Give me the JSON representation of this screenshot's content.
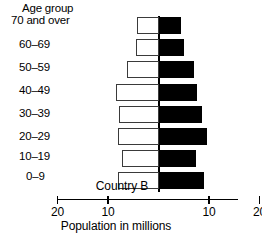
{
  "chart_data": {
    "type": "bar",
    "subtype": "population-pyramid",
    "title": "",
    "series_caption": "Country B",
    "category_axis_label": "Age group",
    "xlabel": "Population in millions",
    "ylabel": "Age group",
    "grid": false,
    "legend": "none",
    "orientation": "horizontal-diverging",
    "categories": [
      "70 and over",
      "60–69",
      "50–59",
      "40–49",
      "30–39",
      "20–29",
      "10–19",
      "0–9"
    ],
    "xlim": [
      -20,
      20
    ],
    "xticks": [
      20,
      10,
      0,
      10,
      20
    ],
    "xtick_labels": [
      "20",
      "10",
      "",
      "10",
      "20"
    ],
    "series": [
      {
        "name": "left-side",
        "fill": "white",
        "values": [
          4.2,
          4.5,
          6.3,
          8.5,
          7.8,
          8.0,
          7.3,
          8.0
        ]
      },
      {
        "name": "right-side",
        "fill": "black",
        "values": [
          4.5,
          5.0,
          7.0,
          7.7,
          8.5,
          9.5,
          7.5,
          9.0
        ]
      }
    ],
    "colors": {
      "left_fill": "#ffffff",
      "left_stroke": "#3a3a3a",
      "right_fill": "#000000",
      "axis": "#000000",
      "background": "#ffffff"
    }
  },
  "axis": {
    "tick_labels": [
      "20",
      "10",
      "10",
      "20"
    ]
  }
}
